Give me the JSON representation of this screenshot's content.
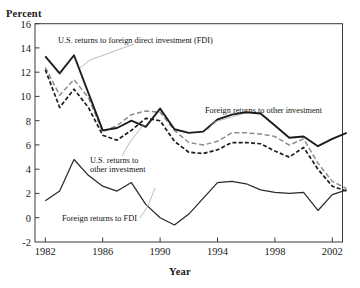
{
  "axis_titles": {
    "y": "Percent",
    "x": "Year"
  },
  "yticks": [
    "16",
    "14",
    "12",
    "10",
    "8",
    "6",
    "4",
    "2",
    "0",
    "-2"
  ],
  "xticks": [
    "1982",
    "1986",
    "1990",
    "1994",
    "1998",
    "2002"
  ],
  "annotations": [
    {
      "name": "us-returns-fdi-label",
      "text": "U.S. returns to foreign direct investment (FDI)"
    },
    {
      "name": "foreign-returns-other-label",
      "text": "Foreign returns to other investment"
    },
    {
      "name": "us-returns-other-label-l1",
      "text": "U.S. returns to"
    },
    {
      "name": "us-returns-other-label-l2",
      "text": "other investment"
    },
    {
      "name": "foreign-returns-fdi-label",
      "text": "Foreign returns to FDI"
    }
  ],
  "colors": {
    "us_fdi": "#1c1c1c",
    "foreign_other": "#8d8d8d",
    "us_other": "#1c1c1c",
    "foreign_fdi": "#2a2a2a",
    "frame": "#3a3a3a",
    "leader": "#a9a9a9"
  },
  "chart_data": {
    "type": "line",
    "title": "",
    "xlabel": "Year",
    "ylabel": "Percent",
    "xlim": [
      1982,
      2003
    ],
    "ylim": [
      -2,
      16
    ],
    "ytick_step": 2,
    "xtick_step": 4,
    "grid": false,
    "legend": "annotated-inline",
    "x": [
      1982,
      1983,
      1984,
      1985,
      1986,
      1987,
      1988,
      1989,
      1990,
      1991,
      1992,
      1993,
      1994,
      1995,
      1996,
      1997,
      1998,
      1999,
      2000,
      2001,
      2002,
      2003
    ],
    "series": [
      {
        "name": "U.S. returns to foreign direct investment (FDI)",
        "style": "solid-thick",
        "color": "#1c1c1c",
        "values": [
          13.3,
          11.9,
          13.4,
          10.3,
          7.2,
          7.4,
          8.0,
          7.5,
          9.0,
          7.3,
          7.0,
          7.1,
          8.1,
          8.5,
          8.7,
          8.6,
          7.6,
          6.6,
          6.7,
          5.9,
          6.5,
          7.0
        ]
      },
      {
        "name": "Foreign returns to other investment",
        "style": "gray-dashed",
        "color": "#8d8d8d",
        "values": [
          12.4,
          10.1,
          11.4,
          9.9,
          7.1,
          7.6,
          8.5,
          8.8,
          8.7,
          7.2,
          6.2,
          6.0,
          6.3,
          7.0,
          7.0,
          6.9,
          6.7,
          6.0,
          6.5,
          4.5,
          3.0,
          2.4
        ]
      },
      {
        "name": "U.S. returns to other investment",
        "style": "black-dashed",
        "color": "#1c1c1c",
        "values": [
          12.2,
          9.1,
          10.6,
          9.1,
          6.8,
          6.4,
          7.2,
          8.2,
          8.0,
          6.3,
          5.4,
          5.3,
          5.6,
          6.2,
          6.2,
          6.1,
          5.5,
          5.0,
          5.8,
          4.0,
          2.6,
          2.2
        ]
      },
      {
        "name": "Foreign returns to FDI",
        "style": "solid-thin",
        "color": "#2a2a2a",
        "values": [
          1.4,
          2.2,
          4.8,
          3.5,
          2.6,
          2.2,
          2.9,
          1.1,
          0.0,
          -0.6,
          0.3,
          1.6,
          2.9,
          3.0,
          2.8,
          2.3,
          2.1,
          2.0,
          2.1,
          0.6,
          1.9,
          2.3
        ]
      }
    ]
  }
}
